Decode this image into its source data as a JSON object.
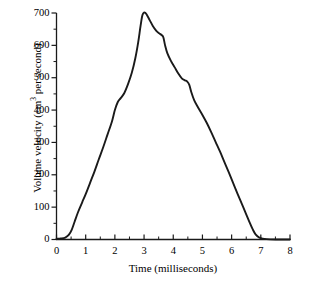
{
  "chart_data": {
    "type": "line",
    "title": "",
    "xlabel": "Time (milliseconds)",
    "ylabel_text": "Volume velocity (cm",
    "ylabel_sup": "3",
    "ylabel_tail": " per second)",
    "ylabel_plain": "Volume velocity (cm3 per second)",
    "xlim": [
      0,
      8
    ],
    "ylim": [
      0,
      700
    ],
    "grid": false,
    "legend": "none",
    "line_color": "#1a1a1a",
    "background_color": "#ffffff",
    "xticks": [
      0,
      1,
      2,
      3,
      4,
      5,
      6,
      7,
      8
    ],
    "xtick_labels": [
      "0",
      "1",
      "2",
      "3",
      "4",
      "5",
      "6",
      "7",
      "8"
    ],
    "x_minor_ticks": [
      0.5,
      1.5,
      2.5,
      3.5,
      4.5,
      5.5,
      6.5,
      7.5
    ],
    "yticks": [
      0,
      100,
      200,
      300,
      400,
      500,
      600,
      700
    ],
    "ytick_labels": [
      "0",
      "100",
      "200",
      "300",
      "400",
      "500",
      "600",
      "700"
    ],
    "y_minor_ticks": [
      50,
      150,
      250,
      350,
      450,
      550,
      650
    ],
    "series": [
      {
        "name": "glottal volume velocity",
        "x": [
          0.0,
          0.15,
          0.3,
          0.42,
          0.52,
          0.62,
          0.74,
          0.88,
          1.0,
          1.15,
          1.3,
          1.45,
          1.6,
          1.75,
          1.9,
          2.0,
          2.1,
          2.2,
          2.32,
          2.45,
          2.58,
          2.7,
          2.8,
          2.88,
          2.95,
          3.05,
          3.18,
          3.3,
          3.42,
          3.52,
          3.6,
          3.66,
          3.72,
          3.8,
          3.92,
          4.05,
          4.18,
          4.3,
          4.4,
          4.48,
          4.55,
          4.62,
          4.72,
          4.85,
          5.0,
          5.15,
          5.3,
          5.45,
          5.6,
          5.75,
          5.9,
          6.05,
          6.2,
          6.35,
          6.5,
          6.62,
          6.72,
          6.82,
          6.95,
          7.2,
          7.6,
          8.0
        ],
        "y": [
          2,
          3,
          6,
          14,
          30,
          55,
          85,
          115,
          140,
          175,
          210,
          248,
          285,
          325,
          365,
          400,
          425,
          437,
          452,
          480,
          515,
          560,
          610,
          660,
          695,
          700,
          680,
          660,
          645,
          637,
          632,
          625,
          600,
          575,
          552,
          532,
          512,
          497,
          492,
          488,
          478,
          455,
          430,
          408,
          385,
          360,
          332,
          302,
          272,
          240,
          208,
          175,
          142,
          110,
          78,
          52,
          32,
          16,
          6,
          1,
          0,
          0
        ],
        "peak_value": 700,
        "peak_time": 2.95,
        "onset_time": 0.35,
        "offset_time": 6.95
      }
    ]
  }
}
